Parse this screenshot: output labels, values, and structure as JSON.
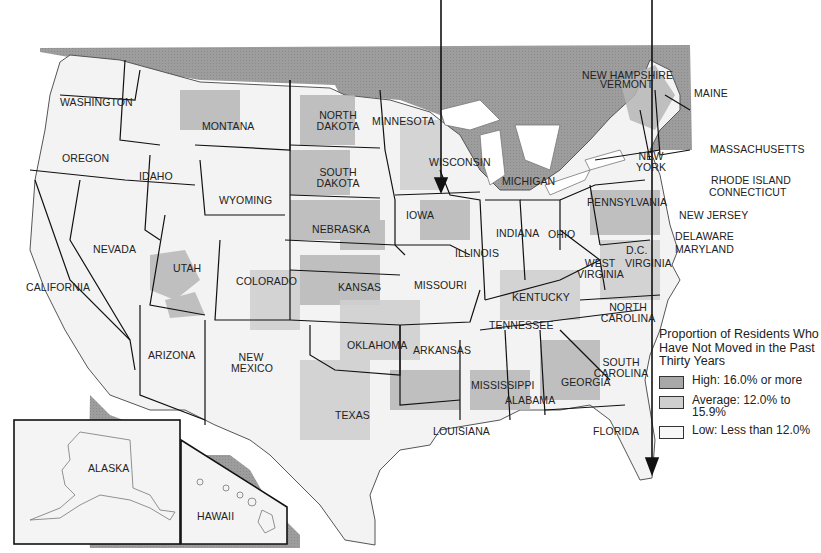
{
  "map": {
    "type": "choropleth",
    "subject": "Proportion of Residents Who Have Not Moved in the Past Thirty Years",
    "colors": {
      "foreign_land": "#9a9a9a",
      "high": "#a8a8a8",
      "average": "#cfcfcf",
      "low": "#f4f4f4",
      "border": "#111111",
      "water": "#ffffff"
    }
  },
  "legend": {
    "title": "Proportion of Residents Who Have Not Moved in the Past Thirty Years",
    "items": [
      {
        "label": "High: 16.0% or more",
        "color": "#a8a8a8"
      },
      {
        "label": "Average:  12.0% to 15.9%",
        "color": "#cfcfcf"
      },
      {
        "label": "Low:  Less than 12.0%",
        "color": "#f7f7f7"
      }
    ]
  },
  "states": {
    "washington": "WASHINGTON",
    "oregon": "OREGON",
    "california": "CALIFORNIA",
    "idaho": "IDAHO",
    "nevada": "NEVADA",
    "montana": "MONTANA",
    "wyoming": "WYOMING",
    "utah": "UTAH",
    "colorado": "COLORADO",
    "arizona": "ARIZONA",
    "new_mexico": "NEW MEXICO",
    "north_dakota": "NORTH DAKOTA",
    "south_dakota": "SOUTH DAKOTA",
    "nebraska": "NEBRASKA",
    "kansas": "KANSAS",
    "oklahoma": "OKLAHOMA",
    "texas": "TEXAS",
    "minnesota": "MINNESOTA",
    "iowa": "IOWA",
    "missouri": "MISSOURI",
    "arkansas": "ARKANSAS",
    "louisiana": "LOUISIANA",
    "wisconsin": "WISCONSIN",
    "illinois": "ILLINOIS",
    "michigan": "MICHIGAN",
    "indiana": "INDIANA",
    "ohio": "OHIO",
    "kentucky": "KENTUCKY",
    "tennessee": "TENNESSEE",
    "mississippi": "MISSISSIPPI",
    "alabama": "ALABAMA",
    "georgia": "GEORGIA",
    "florida": "FLORIDA",
    "south_carolina": "SOUTH CAROLINA",
    "north_carolina": "NORTH CAROLINA",
    "virginia": "VIRGINIA",
    "west_virginia": "WEST VIRGINIA",
    "dc": "D.C.",
    "maryland": "MARYLAND",
    "delaware": "DELAWARE",
    "new_jersey": "NEW JERSEY",
    "pennsylvania": "PENNSYLVANIA",
    "new_york": "NEW YORK",
    "connecticut": "CONNECTICUT",
    "rhode_island": "RHODE ISLAND",
    "massachusetts": "MASSACHUSETTS",
    "vermont": "VERMONT",
    "new_hampshire": "NEW HAMPSHIRE",
    "maine": "MAINE",
    "alaska": "ALASKA",
    "hawaii": "HAWAII"
  }
}
